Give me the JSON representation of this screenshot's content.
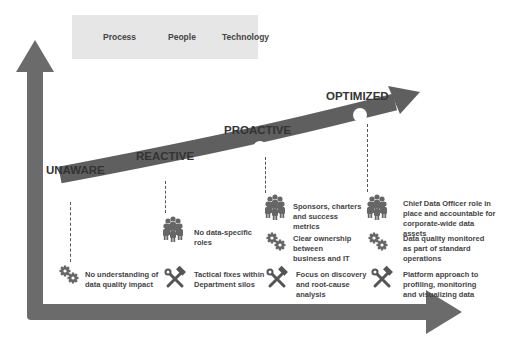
{
  "legend": {
    "items": [
      {
        "label": "Process",
        "icon": "gears-icon"
      },
      {
        "label": "People",
        "icon": "people-icon"
      },
      {
        "label": "Technology",
        "icon": "tools-icon"
      }
    ]
  },
  "stages": [
    {
      "label": "UNAWARE"
    },
    {
      "label": "REACTIVE"
    },
    {
      "label": "PROACTIVE"
    },
    {
      "label": "OPTIMIZED"
    }
  ],
  "notes": {
    "unaware_process": "No understanding of data quality impact",
    "reactive_people": "No data-specific roles",
    "reactive_tech": "Tactical fixes within Department silos",
    "proactive_people": "Sponsors, charters and success metrics",
    "proactive_process": "Clear ownership between business and IT",
    "proactive_tech": "Focus on discovery and root-cause analysis",
    "optimized_people": "Chief Data Officer role in place and accountable for corporate-wide data assets",
    "optimized_process": "Data quality monitored as part of standard operations",
    "optimized_tech": "Platform approach to profiling, monitoring and visualizing data"
  },
  "colors": {
    "arrow": "#666666",
    "axis": "#6b6b6b",
    "legend_bg": "#e6e6e6",
    "icon": "#5a5a5a"
  }
}
